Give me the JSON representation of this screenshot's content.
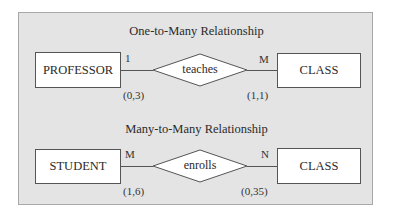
{
  "sections": [
    {
      "title": "One-to-Many Relationship",
      "left_entity": "PROFESSOR",
      "relationship": "teaches",
      "right_entity": "CLASS",
      "left_cardinality": "1",
      "left_participation": "(0,3)",
      "right_cardinality": "M",
      "right_participation": "(1,1)"
    },
    {
      "title": "Many-to-Many Relationship",
      "left_entity": "STUDENT",
      "relationship": "enrolls",
      "right_entity": "CLASS",
      "left_cardinality": "M",
      "left_participation": "(1,6)",
      "right_cardinality": "N",
      "right_participation": "(0,35)"
    }
  ]
}
